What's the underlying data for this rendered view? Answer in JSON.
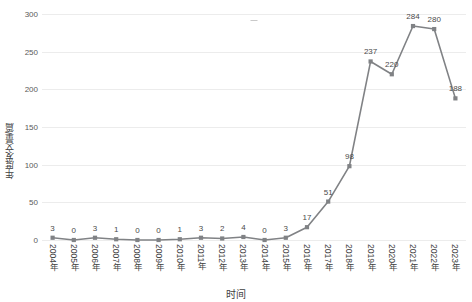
{
  "chart_data": {
    "type": "line",
    "title": "",
    "xlabel": "时间",
    "ylabel": "年度发文量/篇",
    "categories": [
      "2004年",
      "2005年",
      "2006年",
      "2007年",
      "2008年",
      "2009年",
      "2010年",
      "2011年",
      "2012年",
      "2013年",
      "2014年",
      "2015年",
      "2016年",
      "2017年",
      "2018年",
      "2019年",
      "2020年",
      "2021年",
      "2022年",
      "2023年"
    ],
    "values": [
      3,
      0,
      3,
      1,
      0,
      0,
      1,
      3,
      2,
      4,
      0,
      3,
      17,
      51,
      98,
      237,
      220,
      284,
      280,
      188
    ],
    "point_labels": [
      "3",
      "0",
      "3",
      "1",
      "0",
      "0",
      "1",
      "3",
      "2",
      "4",
      "0",
      "3",
      "17",
      "51",
      "98",
      "237",
      "220",
      "284",
      "280",
      "188"
    ],
    "ylim": [
      0,
      300
    ],
    "yticks": [
      0,
      50,
      100,
      150,
      200,
      250,
      300
    ],
    "ytick_labels": [
      "0",
      "50",
      "100",
      "150",
      "200",
      "250",
      "300"
    ],
    "grid": true,
    "legend": "none",
    "series_color": "#808285",
    "marker_color": "#808285",
    "grid_color": "#ececec",
    "text_color": "#3f3f3f"
  }
}
